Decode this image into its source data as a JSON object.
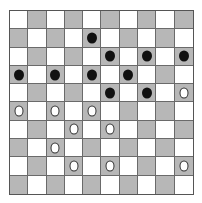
{
  "board": {
    "size": 10,
    "colors": {
      "light": "#ffffff",
      "dark": "#b7b7b7",
      "black_piece": "#111111",
      "white_piece": "#ffffff"
    },
    "top_left_cell": "light",
    "pieces": [
      {
        "row": 1,
        "col": 4,
        "color": "black"
      },
      {
        "row": 2,
        "col": 5,
        "color": "black"
      },
      {
        "row": 2,
        "col": 7,
        "color": "black"
      },
      {
        "row": 2,
        "col": 9,
        "color": "black"
      },
      {
        "row": 3,
        "col": 0,
        "color": "black"
      },
      {
        "row": 3,
        "col": 2,
        "color": "black"
      },
      {
        "row": 3,
        "col": 4,
        "color": "black"
      },
      {
        "row": 3,
        "col": 6,
        "color": "black"
      },
      {
        "row": 4,
        "col": 5,
        "color": "black"
      },
      {
        "row": 4,
        "col": 7,
        "color": "black"
      },
      {
        "row": 4,
        "col": 9,
        "color": "white"
      },
      {
        "row": 5,
        "col": 0,
        "color": "white"
      },
      {
        "row": 5,
        "col": 2,
        "color": "white"
      },
      {
        "row": 5,
        "col": 4,
        "color": "white"
      },
      {
        "row": 6,
        "col": 3,
        "color": "white"
      },
      {
        "row": 6,
        "col": 5,
        "color": "white"
      },
      {
        "row": 7,
        "col": 2,
        "color": "white"
      },
      {
        "row": 8,
        "col": 3,
        "color": "white"
      },
      {
        "row": 8,
        "col": 5,
        "color": "white"
      },
      {
        "row": 8,
        "col": 9,
        "color": "white"
      }
    ]
  }
}
